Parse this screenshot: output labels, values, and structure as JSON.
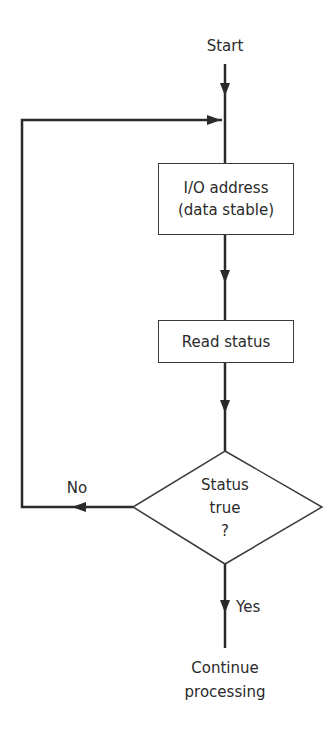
{
  "diagram": {
    "type": "flowchart",
    "start": {
      "label": "Start"
    },
    "nodes": [
      {
        "id": "io-address",
        "shape": "rectangle",
        "lines": [
          "I/O address",
          "(data stable)"
        ]
      },
      {
        "id": "read-status",
        "shape": "rectangle",
        "lines": [
          "Read status"
        ]
      },
      {
        "id": "status-decision",
        "shape": "diamond",
        "lines": [
          "Status",
          "true",
          "?"
        ]
      }
    ],
    "branches": {
      "no": {
        "label": "No",
        "target": "io-address"
      },
      "yes": {
        "label": "Yes",
        "target": "end"
      }
    },
    "end": {
      "lines": [
        "Continue",
        "processing"
      ]
    }
  }
}
